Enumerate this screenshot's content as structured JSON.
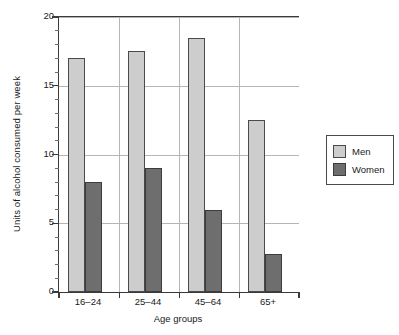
{
  "chart_data": {
    "type": "bar",
    "title": "",
    "categories": [
      "16–24",
      "25–44",
      "45–64",
      "65+"
    ],
    "series": [
      {
        "name": "Men",
        "color": "#cdcdcd",
        "values": [
          17.0,
          17.5,
          18.5,
          12.5
        ]
      },
      {
        "name": "Women",
        "color": "#6e6e6e",
        "values": [
          8.0,
          9.0,
          6.0,
          2.8
        ]
      }
    ],
    "xlabel": "Age groups",
    "ylabel": "Units of alcohol consumed per week",
    "ylim": [
      0,
      20
    ],
    "ytick_labels": [
      "0",
      "5",
      "10",
      "15",
      "20"
    ],
    "ytick_values": [
      0,
      5,
      10,
      15,
      20
    ],
    "yminor_step": 1,
    "grid": "horizontal-and-vertical",
    "legend_position": "right"
  },
  "legend": {
    "entries": [
      {
        "label": "Men"
      },
      {
        "label": "Women"
      }
    ]
  },
  "axes": {
    "y_title": "Units of alcohol consumed per week",
    "x_title": "Age groups"
  }
}
